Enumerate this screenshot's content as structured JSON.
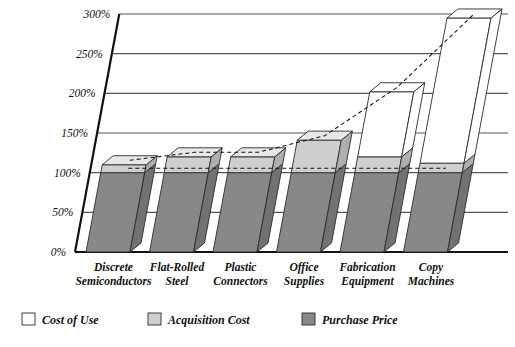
{
  "chart_data": {
    "type": "bar",
    "subtype": "stacked-3d",
    "title": "",
    "subtitle": "",
    "xlabel": "",
    "ylabel": "",
    "ylim": [
      0,
      300
    ],
    "grid": true,
    "legend_position": "bottom",
    "y_ticks": [
      0,
      50,
      100,
      150,
      200,
      250,
      300
    ],
    "y_tick_labels": [
      "0%",
      "50%",
      "100%",
      "150%",
      "200%",
      "250%",
      "300%"
    ],
    "categories": [
      "Discrete Semiconductors",
      "Flat-Rolled Steel",
      "Plastic Connectors",
      "Office Supplies",
      "Fabrication Equipment",
      "Copy Machines"
    ],
    "category_lines": [
      [
        "Discrete",
        "Semiconductors"
      ],
      [
        "Flat-Rolled",
        "Steel"
      ],
      [
        "Plastic",
        "Connectors"
      ],
      [
        "Office",
        "Supplies"
      ],
      [
        "Fabrication",
        "Equipment"
      ],
      [
        "Copy",
        "Machines"
      ]
    ],
    "series": [
      {
        "name": "Purchase Price",
        "color": "#888888",
        "cumulative_top": [
          100,
          100,
          100,
          100,
          100,
          100
        ],
        "values": [
          100,
          100,
          100,
          100,
          100,
          100
        ]
      },
      {
        "name": "Acquisition Cost",
        "color": "#cfcfcf",
        "cumulative_top": [
          110,
          120,
          120,
          141,
          120,
          112
        ],
        "values": [
          10,
          20,
          20,
          41,
          20,
          12
        ]
      },
      {
        "name": "Cost of Use",
        "color": "#ffffff",
        "cumulative_top": [
          110,
          120,
          120,
          141,
          202,
          295
        ],
        "values": [
          0,
          0,
          0,
          0,
          82,
          183
        ]
      }
    ],
    "trend_lines": [
      {
        "name": "purchase-price-trend",
        "values": [
          100,
          100,
          100,
          100,
          100,
          100
        ],
        "style": "dashed"
      },
      {
        "name": "total-cost-trend",
        "values": [
          110,
          120,
          120,
          141,
          202,
          295
        ],
        "style": "dashed"
      }
    ]
  },
  "legend": {
    "items": [
      {
        "label": "Cost of Use",
        "color": "#ffffff"
      },
      {
        "label": "Acquisition Cost",
        "color": "#cfcfcf"
      },
      {
        "label": "Purchase Price",
        "color": "#888888"
      }
    ]
  },
  "colors": {
    "cost_of_use": "#ffffff",
    "acquisition_cost": "#cfcfcf",
    "purchase_price": "#888888",
    "outline": "#2b2b2b",
    "grid": "#555555",
    "axis": "#111111",
    "background": "#ffffff"
  }
}
